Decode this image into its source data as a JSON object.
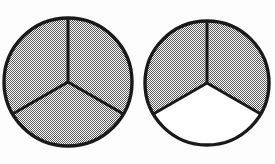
{
  "figure": {
    "title": "Two circles divided into thirds",
    "description": "Left circle with three of three sectors shaded; right circle with two of three sectors shaded.",
    "background_color": "#fdfdfd",
    "outline_color": "#1a1a1a",
    "shaded_fill_color": "#a8a8a8",
    "unshaded_fill_color": "#ffffff",
    "fill_style": "dither-checkerboard",
    "outline_width": 3,
    "spoke_width": 3
  },
  "chart_data": {
    "type": "pie",
    "title": "Two circles divided into thirds",
    "xlabel": "",
    "ylabel": "",
    "charts": [
      {
        "name": "left-circle",
        "center_x": 68,
        "center_y": 82,
        "radius": 64,
        "slice_count": 3,
        "categories": [
          "top-left sector",
          "top-right sector",
          "bottom sector"
        ],
        "values": [
          1,
          1,
          1
        ],
        "shaded": [
          true,
          true,
          true
        ],
        "shaded_count": 3,
        "fraction_label": "3/3",
        "start_angle_deg": 90,
        "slice_angle_deg": 120
      },
      {
        "name": "right-circle",
        "center_x": 207,
        "center_y": 83,
        "radius": 62,
        "slice_count": 3,
        "categories": [
          "top-left sector",
          "top-right sector",
          "bottom sector"
        ],
        "values": [
          1,
          1,
          1
        ],
        "shaded": [
          true,
          false,
          true
        ],
        "shaded_count": 2,
        "fraction_label": "2/3",
        "start_angle_deg": 90,
        "slice_angle_deg": 120
      }
    ],
    "legend": [],
    "grid": false
  }
}
